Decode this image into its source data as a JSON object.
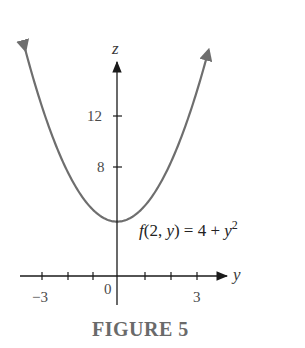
{
  "chart_data": {
    "type": "line",
    "title": "",
    "caption": "FIGURE 5",
    "xlabel": "y",
    "ylabel": "z",
    "series": [
      {
        "name": "f(2, y) = 4 + y^2",
        "function": "4 + y^2",
        "x": [
          -3.6,
          -3,
          -2,
          -1,
          0,
          1,
          2,
          3,
          3.6
        ],
        "values": [
          16.96,
          13,
          8,
          5,
          4,
          5,
          8,
          13,
          16.96
        ]
      }
    ],
    "x_ticks": [
      -3,
      -2,
      -1,
      0,
      1,
      2,
      3
    ],
    "x_tick_labels": [
      "-3",
      "0",
      "3"
    ],
    "y_ticks": [
      8,
      12
    ],
    "y_tick_labels": [
      "12",
      "8"
    ],
    "xlim": [
      -3.7,
      4.3
    ],
    "ylim": [
      -1.5,
      17.5
    ],
    "grid": false,
    "legend": "none",
    "annotations": [
      {
        "text": "f(2, y) = 4 + y²",
        "at": [
          0.2,
          3
        ]
      }
    ],
    "colors": {
      "curve": "#6e6e6e",
      "axes": "#3a3a3a"
    }
  },
  "labels": {
    "z_axis": "z",
    "y_axis": "y",
    "tick_12": "12",
    "tick_8": "8",
    "tick_neg3": "−3",
    "tick_0": "0",
    "tick_3": "3",
    "eq_f": "f",
    "eq_args_open": "(2, ",
    "eq_y": "y",
    "eq_args_close": ") = 4 + ",
    "eq_y2": "y",
    "eq_exp": "2",
    "caption": "FIGURE 5"
  }
}
